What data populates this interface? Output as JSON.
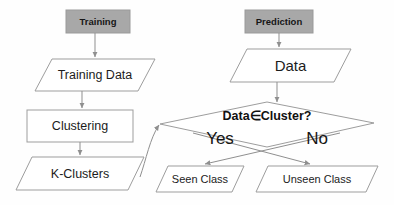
{
  "diagram": {
    "colors": {
      "header_fill": "#a8a8a8",
      "header_stroke": "#9a9a9a",
      "shape_stroke": "#9d9d9d",
      "connector_stroke": "#8f8f8f",
      "text": "#1a1a1a",
      "background": "#fefefe"
    },
    "headers": [
      {
        "id": "training",
        "label": "Training"
      },
      {
        "id": "prediction",
        "label": "Prediction"
      }
    ],
    "nodes": [
      {
        "id": "training-data",
        "label": "Training Data",
        "shape": "parallelogram"
      },
      {
        "id": "clustering",
        "label": "Clustering",
        "shape": "rectangle"
      },
      {
        "id": "k-clusters",
        "label": "K-Clusters",
        "shape": "parallelogram"
      },
      {
        "id": "data",
        "label": "Data",
        "shape": "parallelogram"
      },
      {
        "id": "decision",
        "label": "Data∈Cluster?",
        "shape": "diamond"
      },
      {
        "id": "seen-class",
        "label": "Seen Class",
        "shape": "parallelogram"
      },
      {
        "id": "unseen-class",
        "label": "Unseen Class",
        "shape": "parallelogram"
      }
    ],
    "branches": [
      {
        "id": "yes",
        "label": "Yes"
      },
      {
        "id": "no",
        "label": "No"
      }
    ]
  }
}
